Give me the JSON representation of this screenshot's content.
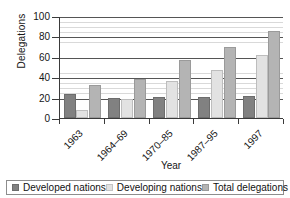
{
  "chart_data": {
    "type": "bar",
    "title": "",
    "xlabel": "Year",
    "ylabel": "Delegations",
    "categories": [
      "1963",
      "1964–69",
      "1970–85",
      "1987–95",
      "1997"
    ],
    "series": [
      {
        "name": "Developed nations",
        "color": "#818181",
        "values": [
          24,
          20,
          21,
          21,
          22
        ]
      },
      {
        "name": "Developing nations",
        "color": "#e2e2e2",
        "values": [
          8,
          19,
          36,
          47,
          62
        ]
      },
      {
        "name": "Total delegations",
        "color": "#b4b4b4",
        "values": [
          32,
          38,
          57,
          70,
          85
        ]
      }
    ],
    "ylim": [
      0,
      100
    ],
    "yticks": [
      0,
      20,
      40,
      60,
      80,
      100
    ],
    "ytick_labels": [
      "0",
      "20",
      "40",
      "60",
      "80",
      "100"
    ],
    "grid": "horizontal-major-and-minor",
    "minor_tick_step": 5,
    "legend_position": "bottom",
    "legend": [
      "Developed nations",
      "Developing nations",
      "Total delegations"
    ],
    "xlabel_rotation": -45
  },
  "axis": {
    "y_title": "Delegations",
    "x_title": "Year"
  },
  "legend": {
    "items": [
      {
        "label": "Developed nations",
        "swatch": "developed-swatch-icon"
      },
      {
        "label": "Developing nations",
        "swatch": "developing-swatch-icon"
      },
      {
        "label": "Total delegations",
        "swatch": "total-swatch-icon"
      }
    ]
  },
  "colors": {
    "developed": "#818181",
    "developing": "#e2e2e2",
    "total": "#b4b4b4",
    "axis": "#3a3a3a",
    "major_grid": "#555555",
    "minor_grid": "#d9d9d9",
    "background": "#ffffff"
  }
}
